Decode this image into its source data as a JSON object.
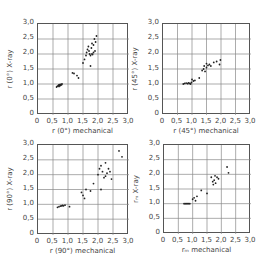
{
  "chart_data": [
    {
      "type": "scatter",
      "title": "",
      "xlabel": "r (0°) mechanical",
      "ylabel": "r (0°) X-ray",
      "xlim": [
        0,
        3.0
      ],
      "ylim": [
        0,
        3.0
      ],
      "xticks": [
        "0",
        "0,5",
        "1,0",
        "1,5",
        "2,0",
        "2,5",
        "3,0"
      ],
      "yticks": [
        "0",
        "0,5",
        "1,0",
        "1,5",
        "2,0",
        "2,5",
        "3,0"
      ],
      "grid": true,
      "points": [
        [
          0.62,
          0.9
        ],
        [
          0.65,
          0.93
        ],
        [
          0.68,
          0.95
        ],
        [
          0.7,
          0.97
        ],
        [
          0.72,
          0.98
        ],
        [
          0.74,
          0.96
        ],
        [
          0.76,
          0.99
        ],
        [
          0.78,
          0.97
        ],
        [
          0.8,
          1.0
        ],
        [
          0.73,
          0.94
        ],
        [
          0.7,
          0.92
        ],
        [
          1.15,
          1.37
        ],
        [
          1.2,
          1.35
        ],
        [
          1.3,
          1.28
        ],
        [
          1.35,
          1.2
        ],
        [
          1.5,
          1.7
        ],
        [
          1.55,
          1.82
        ],
        [
          1.6,
          1.95
        ],
        [
          1.62,
          2.05
        ],
        [
          1.65,
          2.15
        ],
        [
          1.7,
          2.1
        ],
        [
          1.72,
          2.0
        ],
        [
          1.75,
          1.95
        ],
        [
          1.75,
          1.6
        ],
        [
          1.78,
          2.2
        ],
        [
          1.8,
          2.0
        ],
        [
          1.82,
          1.98
        ],
        [
          1.85,
          2.05
        ],
        [
          1.85,
          2.3
        ],
        [
          1.88,
          2.5
        ],
        [
          1.9,
          2.1
        ],
        [
          1.92,
          2.4
        ],
        [
          1.95,
          2.6
        ],
        [
          1.68,
          2.25
        ],
        [
          1.8,
          2.35
        ]
      ]
    },
    {
      "type": "scatter",
      "title": "",
      "xlabel": "r (45°) mechanical",
      "ylabel": "r (45°) X-ray",
      "xlim": [
        0,
        3.0
      ],
      "ylim": [
        0,
        3.0
      ],
      "xticks": [
        "0",
        "0,5",
        "1,0",
        "1,5",
        "2,0",
        "2,5",
        "3,0"
      ],
      "yticks": [
        "0",
        "0,5",
        "1,0",
        "1,5",
        "2,0",
        "2,5",
        "3,0"
      ],
      "grid": true,
      "points": [
        [
          0.7,
          1.0
        ],
        [
          0.75,
          1.02
        ],
        [
          0.8,
          1.03
        ],
        [
          0.85,
          1.01
        ],
        [
          0.88,
          1.04
        ],
        [
          0.92,
          1.02
        ],
        [
          0.95,
          1.0
        ],
        [
          0.98,
          1.05
        ],
        [
          1.0,
          1.15
        ],
        [
          1.05,
          1.1
        ],
        [
          1.1,
          1.12
        ],
        [
          1.25,
          1.2
        ],
        [
          1.35,
          1.45
        ],
        [
          1.4,
          1.5
        ],
        [
          1.42,
          1.6
        ],
        [
          1.45,
          1.42
        ],
        [
          1.5,
          1.55
        ],
        [
          1.5,
          1.68
        ],
        [
          1.55,
          1.62
        ],
        [
          1.6,
          1.65
        ],
        [
          1.65,
          1.6
        ],
        [
          1.75,
          1.72
        ],
        [
          1.85,
          1.75
        ],
        [
          1.95,
          1.65
        ],
        [
          1.98,
          1.8
        ]
      ]
    },
    {
      "type": "scatter",
      "title": "",
      "xlabel": "r (90°) mechanical",
      "ylabel": "r (90°) X-ray",
      "xlim": [
        0,
        3.0
      ],
      "ylim": [
        0,
        3.0
      ],
      "xticks": [
        "0",
        "0,5",
        "1,0",
        "1,5",
        "2,0",
        "2,5",
        "3,0"
      ],
      "yticks": [
        "0",
        "0,5",
        "1,0",
        "1,5",
        "2,0",
        "2,5",
        "3,0"
      ],
      "grid": true,
      "points": [
        [
          0.65,
          0.9
        ],
        [
          0.7,
          0.92
        ],
        [
          0.75,
          0.94
        ],
        [
          0.78,
          0.95
        ],
        [
          0.82,
          0.96
        ],
        [
          0.85,
          0.95
        ],
        [
          0.9,
          0.97
        ],
        [
          1.05,
          0.92
        ],
        [
          1.45,
          1.4
        ],
        [
          1.5,
          1.3
        ],
        [
          1.55,
          1.2
        ],
        [
          1.6,
          1.5
        ],
        [
          1.75,
          1.45
        ],
        [
          1.85,
          1.7
        ],
        [
          2.0,
          2.0
        ],
        [
          2.05,
          2.2
        ],
        [
          2.1,
          2.3
        ],
        [
          2.15,
          2.1
        ],
        [
          2.2,
          1.9
        ],
        [
          2.25,
          2.4
        ],
        [
          2.25,
          1.95
        ],
        [
          2.3,
          2.05
        ],
        [
          2.35,
          2.2
        ],
        [
          2.4,
          2.1
        ],
        [
          2.45,
          1.85
        ],
        [
          2.1,
          1.5
        ],
        [
          2.7,
          2.8
        ],
        [
          2.8,
          2.6
        ]
      ]
    },
    {
      "type": "scatter",
      "title": "",
      "xlabel": "r_m mechanical",
      "ylabel": "r_m X-ray",
      "xlim": [
        0,
        3.0
      ],
      "ylim": [
        0,
        3.0
      ],
      "xticks": [
        "0",
        "0,5",
        "1,0",
        "1,5",
        "2,0",
        "2,5",
        "3,0"
      ],
      "yticks": [
        "0",
        "0,5",
        "1,0",
        "1,5",
        "2,0",
        "2,5",
        "3,0"
      ],
      "grid": true,
      "points": [
        [
          0.7,
          1.0
        ],
        [
          0.74,
          1.0
        ],
        [
          0.78,
          1.0
        ],
        [
          0.82,
          1.0
        ],
        [
          0.86,
          1.0
        ],
        [
          0.9,
          1.0
        ],
        [
          1.0,
          1.15
        ],
        [
          1.05,
          1.2
        ],
        [
          1.1,
          1.1
        ],
        [
          1.15,
          1.25
        ],
        [
          1.3,
          1.45
        ],
        [
          1.5,
          1.35
        ],
        [
          1.65,
          1.9
        ],
        [
          1.7,
          1.75
        ],
        [
          1.72,
          1.65
        ],
        [
          1.75,
          1.8
        ],
        [
          1.78,
          1.95
        ],
        [
          1.8,
          1.7
        ],
        [
          1.85,
          1.9
        ],
        [
          1.9,
          1.85
        ],
        [
          2.2,
          2.25
        ],
        [
          2.25,
          2.05
        ]
      ]
    }
  ],
  "panels": [
    {
      "xlabel": "r (0°) mechanical",
      "ylabel": "r (0°) X-ray"
    },
    {
      "xlabel": "r (45°) mechanical",
      "ylabel": "r (45°) X-ray"
    },
    {
      "xlabel": "r (90°) mechanical",
      "ylabel": "r (90°) X-ray"
    },
    {
      "xlabel": "rₘ mechanical",
      "ylabel": "rₘ X-ray"
    }
  ],
  "ticks": [
    "0",
    "0,5",
    "1,0",
    "1,5",
    "2,0",
    "2,5",
    "3,0"
  ]
}
